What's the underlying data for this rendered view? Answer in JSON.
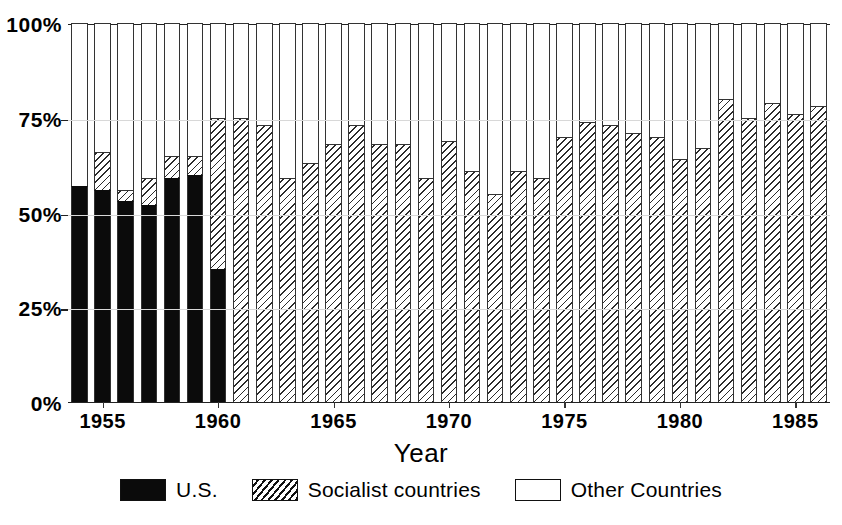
{
  "chart_data": {
    "type": "bar",
    "subtype": "stacked-percentage-column",
    "title": "",
    "xlabel": "Year",
    "ylabel": "",
    "ylim": [
      0,
      100
    ],
    "yticks": [
      "0%",
      "25%",
      "50%",
      "75%",
      "100%"
    ],
    "ytick_values": [
      0,
      25,
      50,
      75,
      100
    ],
    "xticks": [
      "1955",
      "1960",
      "1965",
      "1970",
      "1975",
      "1980",
      "1985"
    ],
    "xtick_values": [
      1955,
      1960,
      1965,
      1970,
      1975,
      1980,
      1985
    ],
    "grid": true,
    "legend_position": "bottom",
    "stack_order": [
      "U.S.",
      "Socialist countries",
      "Other Countries"
    ],
    "categories": [
      1954,
      1955,
      1956,
      1957,
      1958,
      1959,
      1960,
      1961,
      1962,
      1963,
      1964,
      1965,
      1966,
      1967,
      1968,
      1969,
      1970,
      1971,
      1972,
      1973,
      1974,
      1975,
      1976,
      1977,
      1978,
      1979,
      1980,
      1981,
      1982,
      1983,
      1984,
      1985,
      1986
    ],
    "series": [
      {
        "name": "U.S.",
        "color": "#0b0b0b",
        "pattern": "solid",
        "values": [
          57,
          56,
          53,
          52,
          59,
          60,
          35,
          0,
          0,
          0,
          0,
          0,
          0,
          0,
          0,
          0,
          0,
          0,
          0,
          0,
          0,
          0,
          0,
          0,
          0,
          0,
          0,
          0,
          0,
          0,
          0,
          0,
          0
        ]
      },
      {
        "name": "Socialist countries",
        "color": "#2b2b2b",
        "pattern": "diagonal-hatch",
        "values": [
          0,
          10,
          3,
          7,
          6,
          5,
          40,
          75,
          73,
          59,
          63,
          68,
          73,
          68,
          68,
          59,
          69,
          61,
          55,
          61,
          59,
          70,
          74,
          73,
          71,
          70,
          64,
          67,
          80,
          75,
          79,
          76,
          78
        ]
      },
      {
        "name": "Other Countries",
        "color": "#ffffff",
        "pattern": "none",
        "values": [
          43,
          34,
          44,
          41,
          35,
          35,
          25,
          25,
          27,
          41,
          37,
          32,
          27,
          32,
          32,
          41,
          31,
          39,
          45,
          39,
          41,
          30,
          26,
          27,
          29,
          30,
          36,
          33,
          20,
          25,
          21,
          24,
          22
        ]
      }
    ],
    "cumulative_tops": {
      "us": [
        57,
        56,
        53,
        52,
        59,
        60,
        35
      ],
      "soc": [
        57,
        66,
        56,
        59,
        65,
        65,
        75,
        75,
        73,
        59,
        63,
        68,
        73,
        68,
        68,
        59,
        69,
        61,
        55,
        61,
        59,
        70,
        74,
        73,
        71,
        70,
        64,
        67,
        80,
        75,
        79,
        76,
        78
      ]
    }
  },
  "legend": {
    "items": [
      {
        "label": "U.S.",
        "swatch": "solid-black-swatch"
      },
      {
        "label": "Socialist countries",
        "swatch": "hatched-swatch"
      },
      {
        "label": "Other Countries",
        "swatch": "white-swatch"
      }
    ]
  },
  "axis": {
    "x_title": "Year"
  }
}
